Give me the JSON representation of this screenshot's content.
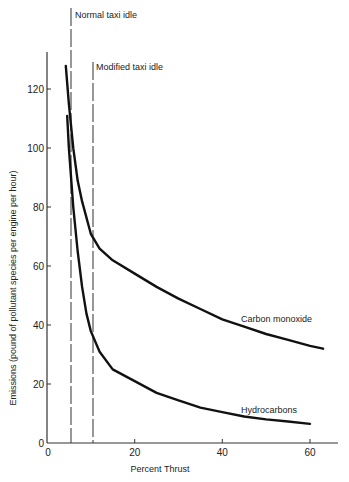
{
  "chart_data": {
    "type": "line",
    "title": "",
    "xlabel": "Percent Thrust",
    "ylabel": "Emissions (pound of pollutant species per engine per hour)",
    "xlim": [
      0,
      65
    ],
    "ylim": [
      0,
      132
    ],
    "xticks": [
      0,
      20,
      40,
      60
    ],
    "yticks": [
      0,
      20,
      40,
      60,
      80,
      100,
      120
    ],
    "grid": false,
    "legend": "none (curves labeled inline)",
    "series": [
      {
        "name": "Carbon monoxide",
        "x": [
          4.3,
          5,
          6,
          7,
          8,
          10,
          12,
          15,
          20,
          25,
          30,
          35,
          40,
          45,
          50,
          55,
          60,
          63
        ],
        "values": [
          128,
          115,
          100,
          89,
          82,
          71,
          66,
          62,
          57.5,
          53,
          49,
          45.5,
          42,
          39.5,
          37,
          35,
          33,
          32
        ]
      },
      {
        "name": "Hydrocarbons",
        "x": [
          4.6,
          5,
          6,
          7,
          8,
          9,
          10,
          12,
          15,
          20,
          25,
          30,
          35,
          40,
          45,
          50,
          55,
          60
        ],
        "values": [
          111,
          100,
          80,
          65,
          53,
          44,
          38,
          31,
          25,
          21,
          17,
          14.5,
          12,
          10.5,
          9,
          8,
          7.3,
          6.5
        ]
      }
    ],
    "vertical_lines": [
      {
        "label": "Normal taxi idle",
        "x": 5.5,
        "style": "dashed"
      },
      {
        "label": "Modified taxi idle",
        "x": 10.5,
        "style": "dashed"
      }
    ],
    "annotations": [
      {
        "text": "Carbon monoxide",
        "x": 45,
        "y": 44
      },
      {
        "text": "Hydrocarbons",
        "x": 45,
        "y": 12
      }
    ]
  },
  "labels": {
    "normal_idle": "Normal taxi idle",
    "modified_idle": "Modified taxi idle",
    "co_curve": "Carbon monoxide",
    "hc_curve": "Hydrocarbons",
    "xlabel": "Percent Thrust",
    "ylabel": "Emissions (pound of pollutant species per engine per hour)",
    "xtick_0": "0",
    "xtick_20": "20",
    "xtick_40": "40",
    "xtick_60": "60",
    "ytick_0": "0",
    "ytick_20": "20",
    "ytick_40": "40",
    "ytick_60": "60",
    "ytick_80": "80",
    "ytick_100": "100",
    "ytick_120": "120"
  }
}
